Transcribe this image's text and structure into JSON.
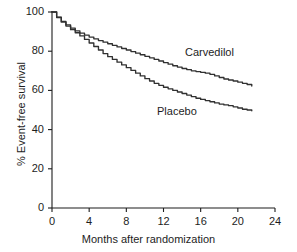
{
  "figure": {
    "background_color": "#ffffff",
    "ink_color": "#1d1d1d"
  },
  "chart_data": {
    "type": "line",
    "title": "",
    "subtitle": "",
    "xlabel": "Months after randomization",
    "ylabel": "% Event-free survival",
    "xlim": [
      0,
      24
    ],
    "ylim": [
      0,
      100
    ],
    "xticks": [
      0,
      4,
      8,
      12,
      16,
      20,
      24
    ],
    "yticks": [
      0,
      20,
      40,
      60,
      80,
      100
    ],
    "xtick_labels": [
      "0",
      "4",
      "8",
      "12",
      "16",
      "20",
      "24"
    ],
    "ytick_labels": [
      "0",
      "20",
      "40",
      "60",
      "80",
      "100"
    ],
    "grid": false,
    "legend_position": "inline-annotation",
    "annotations": [
      {
        "text": "Carvedilol",
        "x": 17.0,
        "y": 72.0
      },
      {
        "text": "Placebo",
        "x": 13.3,
        "y": 50.5
      }
    ],
    "series": [
      {
        "name": "Carvedilol",
        "color": "#303030",
        "x": [
          0,
          0.5,
          1,
          1.5,
          2,
          2.5,
          3,
          3.5,
          4,
          4.5,
          5,
          5.5,
          6,
          6.5,
          7,
          7.5,
          8,
          8.5,
          9,
          9.5,
          10,
          10.5,
          11,
          11.5,
          12,
          12.5,
          13,
          13.5,
          14,
          14.5,
          15,
          15.5,
          16,
          16.5,
          17,
          17.5,
          18,
          18.5,
          19,
          19.5,
          20,
          20.5,
          21,
          21.5
        ],
        "values": [
          100,
          97.4,
          95.2,
          93.4,
          91.8,
          90.4,
          89.2,
          88.2,
          87.2,
          86.3,
          85.4,
          84.6,
          83.8,
          83.0,
          82.2,
          81.4,
          80.6,
          79.8,
          79.0,
          78.2,
          77.4,
          76.6,
          75.8,
          75.0,
          74.2,
          73.4,
          72.6,
          71.9,
          71.2,
          70.6,
          70.0,
          69.6,
          69.2,
          68.8,
          68.2,
          67.4,
          66.6,
          65.8,
          65.3,
          64.8,
          64.2,
          63.6,
          63.0,
          62.2
        ]
      },
      {
        "name": "Placebo",
        "color": "#303030",
        "x": [
          0,
          0.5,
          1,
          1.5,
          2,
          2.5,
          3,
          3.5,
          4,
          4.5,
          5,
          5.5,
          6,
          6.5,
          7,
          7.5,
          8,
          8.5,
          9,
          9.5,
          10,
          10.5,
          11,
          11.5,
          12,
          12.5,
          13,
          13.5,
          14,
          14.5,
          15,
          15.5,
          16,
          16.5,
          17,
          17.5,
          18,
          18.5,
          19,
          19.5,
          20,
          20.5,
          21,
          21.5
        ],
        "values": [
          100,
          97.2,
          94.8,
          92.8,
          91.0,
          89.4,
          87.8,
          86.0,
          84.2,
          82.4,
          80.6,
          78.8,
          77.2,
          75.8,
          74.4,
          73.0,
          71.6,
          70.2,
          68.8,
          67.4,
          66.0,
          64.8,
          63.6,
          62.6,
          61.6,
          60.8,
          60.0,
          59.2,
          58.4,
          57.6,
          56.8,
          56.0,
          55.4,
          54.8,
          54.2,
          53.6,
          53.0,
          52.6,
          52.2,
          51.6,
          51.0,
          50.4,
          50.0,
          49.6
        ]
      }
    ]
  }
}
